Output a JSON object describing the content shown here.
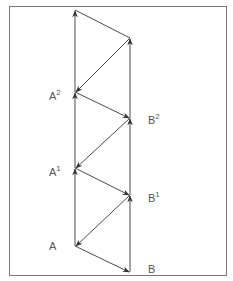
{
  "diagram": {
    "colors": {
      "line": "#4a4a4a",
      "border": "#777777",
      "label": "#555555"
    },
    "points": {
      "A": {
        "x": 75,
        "y": 246
      },
      "B": {
        "x": 130,
        "y": 272
      },
      "A1": {
        "x": 75,
        "y": 168
      },
      "B1": {
        "x": 130,
        "y": 195
      },
      "A2": {
        "x": 75,
        "y": 92
      },
      "B2": {
        "x": 130,
        "y": 118
      },
      "A3": {
        "x": 75,
        "y": 10
      },
      "B3": {
        "x": 130,
        "y": 38
      }
    },
    "labels": {
      "A": {
        "base": "A",
        "sup": ""
      },
      "B": {
        "base": "B",
        "sup": ""
      },
      "A1": {
        "base": "A",
        "sup": "1"
      },
      "B1": {
        "base": "B",
        "sup": "1"
      },
      "A2": {
        "base": "A",
        "sup": "2"
      },
      "B2": {
        "base": "B",
        "sup": "2"
      }
    }
  }
}
